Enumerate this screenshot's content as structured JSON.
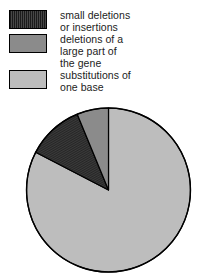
{
  "legend": {
    "items": [
      {
        "label": "small deletions\nor insertions",
        "swatch": "dark",
        "color": "#3b3b3b",
        "pattern": "hatched"
      },
      {
        "label": "deletions of a\nlarge part of\nthe gene",
        "swatch": "medium",
        "color": "#8b8b8b",
        "pattern": "solid"
      },
      {
        "label": "substitutions of\none base",
        "swatch": "light",
        "color": "#bdbdbd",
        "pattern": "solid"
      }
    ]
  },
  "chart_data": {
    "type": "pie",
    "title": "",
    "categories": [
      "substitutions of one base",
      "deletions of a large part of the gene",
      "small deletions or insertions"
    ],
    "values": [
      82.6,
      6.2,
      11.2
    ],
    "units": "percent",
    "colors": [
      "#bdbdbd",
      "#8b8b8b",
      "#3b3b3b"
    ],
    "slice_order_clockwise_from_12": [
      {
        "name": "substitutions of one base",
        "value": 82.6,
        "start_deg": 0,
        "end_deg": 297.4,
        "color": "#bdbdbd",
        "pattern": "solid"
      },
      {
        "name": "small deletions or insertions",
        "value": 11.2,
        "start_deg": 297.4,
        "end_deg": 337.6,
        "color": "#3b3b3b",
        "pattern": "hatched"
      },
      {
        "name": "deletions of a large part of the gene",
        "value": 6.2,
        "start_deg": 337.6,
        "end_deg": 360,
        "color": "#8b8b8b",
        "pattern": "solid"
      }
    ],
    "legend_position": "top",
    "grid": false,
    "xlabel": "",
    "ylabel": "",
    "stroke_color": "#000000",
    "geometry": {
      "cx": 108.5,
      "cy": 90,
      "r": 82
    }
  }
}
